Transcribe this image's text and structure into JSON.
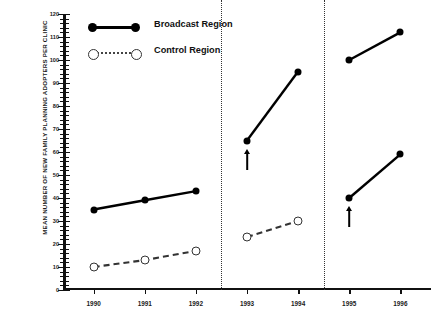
{
  "chart_data": {
    "type": "line",
    "title": "",
    "xlabel": "",
    "ylabel": "MEAN NUMBER OF NEW FAMILY PLANNING ADOPTERS PER CLINIC",
    "x": [
      "1990",
      "1991",
      "1992",
      "1993",
      "1994",
      "1995",
      "1996"
    ],
    "xlim": [
      1989.4,
      1996.6
    ],
    "ylim": [
      0,
      120
    ],
    "ytick_values": [
      0,
      10,
      20,
      30,
      40,
      50,
      60,
      70,
      80,
      90,
      100,
      110,
      120
    ],
    "ytick_labels": [
      "0",
      "10",
      "20",
      "30",
      "40",
      "50",
      "60",
      "70",
      "80",
      "90",
      "100",
      "110",
      "120"
    ],
    "ytick_step": 10,
    "yminor_step": 2,
    "grid": false,
    "legend_position": "top-left",
    "series": [
      {
        "name": "Broadcast Region",
        "marker": "filled-circle",
        "linestyle": "solid",
        "color": "#000000",
        "points": [
          {
            "x": "1990",
            "y": 35
          },
          {
            "x": "1991",
            "y": 39
          },
          {
            "x": "1992",
            "y": 43
          },
          {
            "x": "1993",
            "y": 65
          },
          {
            "x": "1994",
            "y": 95
          },
          {
            "x": "1995",
            "y": 100
          },
          {
            "x": "1996",
            "y": 112
          }
        ]
      },
      {
        "name": "Control Region",
        "marker": "open-circle",
        "linestyle": "dashed",
        "color": "#333333",
        "points": [
          {
            "x": "1990",
            "y": 10
          },
          {
            "x": "1991",
            "y": 13
          },
          {
            "x": "1992",
            "y": 17
          },
          {
            "x": "1993",
            "y": 23
          },
          {
            "x": "1994",
            "y": 30
          },
          {
            "x": "1995",
            "y": 40
          },
          {
            "x": "1996",
            "y": 59
          }
        ]
      }
    ],
    "panels": [
      {
        "label": "1990-1992",
        "years": [
          "1990",
          "1991",
          "1992"
        ]
      },
      {
        "label": "1993-1994",
        "years": [
          "1993",
          "1994"
        ]
      },
      {
        "label": "1995-1996",
        "years": [
          "1995",
          "1996"
        ]
      }
    ],
    "panel_dividers": [
      1992.5,
      1994.5
    ],
    "annotations": [
      {
        "type": "up-arrow",
        "x": "1993",
        "y": 65,
        "series": "Broadcast Region"
      },
      {
        "type": "up-arrow",
        "x": "1995",
        "y": 40,
        "series": "Control Region"
      }
    ]
  },
  "legend": {
    "items": [
      {
        "label": "Broadcast Region",
        "marker": "filled-circle",
        "linestyle": "solid"
      },
      {
        "label": "Control Region",
        "marker": "open-circle",
        "linestyle": "dotted"
      }
    ]
  }
}
